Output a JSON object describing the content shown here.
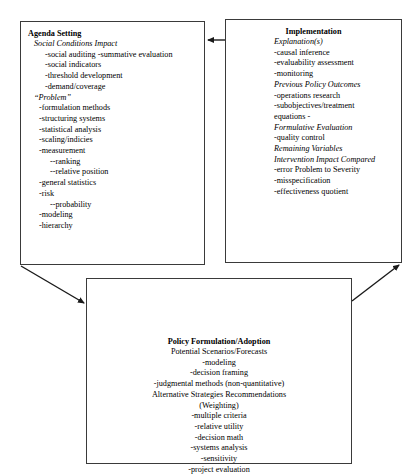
{
  "diagram": {
    "type": "policy-process-cycle-diagram",
    "boxes": [
      {
        "id": "agenda",
        "title": "Agenda Setting",
        "lines": [
          {
            "text": "Social Conditions Impact",
            "style": "italic",
            "indent": 1
          },
          {
            "text": "-social auditing -summative evaluation",
            "style": "normal",
            "indent": 2
          },
          {
            "text": "-social indicators",
            "style": "normal",
            "indent": 2
          },
          {
            "text": "-threshold development",
            "style": "normal",
            "indent": 2
          },
          {
            "text": "-demand/coverage",
            "style": "normal",
            "indent": 2
          },
          {
            "text": "“Problem”",
            "style": "italic",
            "indent": 1
          },
          {
            "text": "-formulation methods",
            "style": "normal",
            "indent": 3
          },
          {
            "text": "-structuring systems",
            "style": "normal",
            "indent": 3
          },
          {
            "text": "-statistical analysis",
            "style": "normal",
            "indent": 3
          },
          {
            "text": "-scaling/indicies",
            "style": "normal",
            "indent": 3
          },
          {
            "text": "-measurement",
            "style": "normal",
            "indent": 3
          },
          {
            "text": "--ranking",
            "style": "normal",
            "indent": 4
          },
          {
            "text": "--relative position",
            "style": "normal",
            "indent": 4
          },
          {
            "text": "-general statistics",
            "style": "normal",
            "indent": 3
          },
          {
            "text": "-risk",
            "style": "normal",
            "indent": 3
          },
          {
            "text": "--probability",
            "style": "normal",
            "indent": 4
          },
          {
            "text": "-modeling",
            "style": "normal",
            "indent": 3
          },
          {
            "text": "-hierarchy",
            "style": "normal",
            "indent": 3
          }
        ]
      },
      {
        "id": "implementation",
        "title": "Implementation",
        "lines": [
          {
            "text": "Explanation(s)",
            "style": "italic",
            "indent": 0
          },
          {
            "text": "-causal inference",
            "style": "normal",
            "indent": 0
          },
          {
            "text": "-evaluability assessment",
            "style": "normal",
            "indent": 0
          },
          {
            "text": "-monitoring",
            "style": "normal",
            "indent": 0
          },
          {
            "text": "Previous Policy Outcomes",
            "style": "italic",
            "indent": 0
          },
          {
            "text": "-operations research",
            "style": "normal",
            "indent": 0
          },
          {
            "text": "-subobjectives/treatment",
            "style": "normal",
            "indent": 0
          },
          {
            "text": "equations -",
            "style": "normal",
            "indent": 0
          },
          {
            "text": "Formulative Evaluation",
            "style": "italic",
            "indent": 0
          },
          {
            "text": "-quality control",
            "style": "normal",
            "indent": 0
          },
          {
            "text": "Remaining Variables",
            "style": "italic",
            "indent": 0
          },
          {
            "text": "Intervention Impact Compared",
            "style": "italic",
            "indent": 0
          },
          {
            "text": "-error   Problem to Severity",
            "style": "normal",
            "indent": 0
          },
          {
            "text": "-misspecification",
            "style": "normal",
            "indent": 0
          },
          {
            "text": "-effectiveness quotient",
            "style": "normal",
            "indent": 0
          }
        ]
      },
      {
        "id": "policy",
        "title": "Policy Formulation/Adoption",
        "lines": [
          {
            "text": "Potential Scenarios/Forecasts",
            "style": "normal",
            "indent": 0
          },
          {
            "text": "-modeling",
            "style": "normal",
            "indent": 0
          },
          {
            "text": "-decision framing",
            "style": "normal",
            "indent": 0
          },
          {
            "text": "-judgmental methods (non-quantitative)",
            "style": "normal",
            "indent": 0
          },
          {
            "text": "Alternative Strategies Recommendations",
            "style": "normal",
            "indent": 0
          },
          {
            "text": "(Weighting)",
            "style": "normal",
            "indent": 0
          },
          {
            "text": "-multiple criteria",
            "style": "normal",
            "indent": 0
          },
          {
            "text": "-relative utility",
            "style": "normal",
            "indent": 0
          },
          {
            "text": "-decision math",
            "style": "normal",
            "indent": 0
          },
          {
            "text": "-systems analysis",
            "style": "normal",
            "indent": 0
          },
          {
            "text": "-sensitivity",
            "style": "normal",
            "indent": 0
          },
          {
            "text": "-project evaluation",
            "style": "normal",
            "indent": 0
          }
        ]
      }
    ],
    "arrows": [
      {
        "id": "implementation-to-agenda",
        "from": "implementation",
        "to": "agenda",
        "direction": "left"
      },
      {
        "id": "agenda-to-policy",
        "from": "agenda",
        "to": "policy",
        "direction": "down-right"
      },
      {
        "id": "policy-to-implementation",
        "from": "policy",
        "to": "implementation",
        "direction": "up-right"
      }
    ],
    "colors": {
      "border": "#3a3a3a",
      "arrow": "#1a1a1a",
      "text": "#000000",
      "background": "#ffffff"
    }
  }
}
